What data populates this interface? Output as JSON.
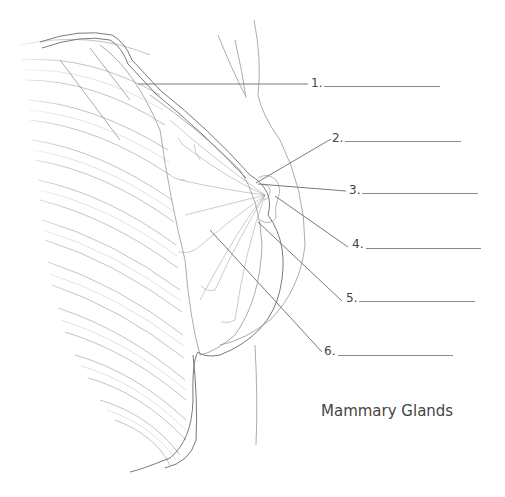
{
  "diagram": {
    "title": "Mammary Glands",
    "labels": [
      {
        "number": "1.",
        "answer": ""
      },
      {
        "number": "2.",
        "answer": ""
      },
      {
        "number": "3.",
        "answer": ""
      },
      {
        "number": "4.",
        "answer": ""
      },
      {
        "number": "5.",
        "answer": ""
      },
      {
        "number": "6.",
        "answer": ""
      }
    ],
    "colors": {
      "line": "#8a8a8a",
      "text": "#444444",
      "background": "#ffffff"
    }
  }
}
